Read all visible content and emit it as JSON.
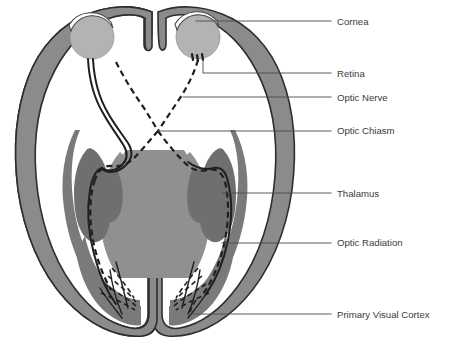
{
  "figure": {
    "background_color": "#ffffff",
    "label_color": "#3b3b3b",
    "leader_color": "#4a4a4a"
  },
  "palette": {
    "brain_fill": "#8b8b8b",
    "brain_outline": "#2e2e2e",
    "cortex_band": "#7a7a7a",
    "thalamus_fill": "#6f6f6f",
    "inner_core": "#909090",
    "eye_fill": "#b3b3b3",
    "cornea_fill": "#ffffff",
    "tract_color": "#1f1f1f"
  },
  "labels": [
    {
      "id": "cornea",
      "text": "Cornea",
      "x": 337,
      "y": 22,
      "leader": "M196,21 L331,21"
    },
    {
      "id": "retina",
      "text": "Retina",
      "x": 337,
      "y": 74,
      "leader": "M203,60 L203,73 L331,73"
    },
    {
      "id": "optic-nerve",
      "text": "Optic Nerve",
      "x": 337,
      "y": 98,
      "leader": "M183,97 L331,97"
    },
    {
      "id": "optic-chiasm",
      "text": "Optic Chiasm",
      "x": 337,
      "y": 131,
      "leader": "M158,131 L331,131"
    },
    {
      "id": "thalamus",
      "text": "Thalamus",
      "x": 337,
      "y": 194,
      "leader": "M222,193 L331,193"
    },
    {
      "id": "optic-radiation",
      "text": "Optic Radiation",
      "x": 337,
      "y": 243,
      "leader": "M222,243 L331,243"
    },
    {
      "id": "primary-visual-cortex",
      "text": "Primary Visual Cortex",
      "x": 337,
      "y": 315,
      "leader": "M190,314 L331,314"
    }
  ],
  "structures": {
    "eyes": [
      {
        "id": "eye-left",
        "cx": 92,
        "cy": 37,
        "r": 22
      },
      {
        "id": "eye-right",
        "cx": 198,
        "cy": 37,
        "r": 22
      }
    ],
    "corneas": [
      {
        "id": "cornea-left",
        "path": "M70,36 A22,22 0 0,1 114,32 L112,27 A24,24 0 0,0 69,31 Z"
      },
      {
        "id": "cornea-right",
        "path": "M176,34 A22,22 0 0,1 220,31 L218,25 A24,24 0 0,0 175,29 Z"
      }
    ]
  }
}
